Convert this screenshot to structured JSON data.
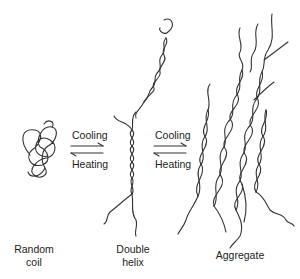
{
  "diagram": {
    "type": "schematic",
    "stages": [
      {
        "id": "random-coil",
        "label_line1": "Random",
        "label_line2": "coil"
      },
      {
        "id": "double-helix",
        "label_line1": "Double",
        "label_line2": "helix"
      },
      {
        "id": "aggregate",
        "label_line1": "Aggregate",
        "label_line2": ""
      }
    ],
    "transitions": [
      {
        "from": "random-coil",
        "to": "double-helix",
        "forward": "Cooling",
        "reverse": "Heating"
      },
      {
        "from": "double-helix",
        "to": "aggregate",
        "forward": "Cooling",
        "reverse": "Heating"
      }
    ],
    "stroke_color": "#333333",
    "background": "#ffffff"
  }
}
